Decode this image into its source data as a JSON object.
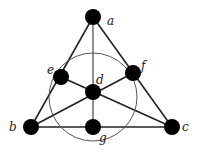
{
  "diagram": {
    "nodes": [
      {
        "id": "a",
        "label": "a",
        "x": 93,
        "y": 17,
        "lx": 107,
        "ly": 25
      },
      {
        "id": "b",
        "label": "b",
        "x": 31,
        "y": 127,
        "lx": 9,
        "ly": 131
      },
      {
        "id": "c",
        "label": "c",
        "x": 172,
        "y": 127,
        "lx": 182,
        "ly": 131
      },
      {
        "id": "d",
        "label": "d",
        "x": 93,
        "y": 92,
        "lx": 96,
        "ly": 84
      },
      {
        "id": "e",
        "label": "e",
        "x": 61,
        "y": 77,
        "lx": 47,
        "ly": 74
      },
      {
        "id": "f",
        "label": "f",
        "x": 133,
        "y": 73,
        "lx": 141,
        "ly": 70
      },
      {
        "id": "g",
        "label": "g",
        "x": 93,
        "y": 127,
        "lx": 99,
        "ly": 142
      }
    ],
    "lines": [
      [
        "a",
        "b"
      ],
      [
        "a",
        "c"
      ],
      [
        "b",
        "c"
      ],
      [
        "a",
        "g"
      ],
      [
        "b",
        "f"
      ],
      [
        "c",
        "e"
      ]
    ],
    "circle": {
      "cx": 93,
      "cy": 97,
      "r": 44
    },
    "colors": {
      "node": "#000000",
      "edge": "#222222",
      "circle": "#555555"
    }
  }
}
